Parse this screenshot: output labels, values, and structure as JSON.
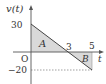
{
  "diagram": {
    "type": "velocity-time graph",
    "y_axis_label": "v(t)",
    "x_axis_label": "t",
    "origin_label": "O",
    "y_ticks": [
      {
        "value": 30,
        "label": "30"
      },
      {
        "value": -20,
        "label": "−20"
      }
    ],
    "x_ticks": [
      {
        "value": 3,
        "label": "3"
      },
      {
        "value": 5,
        "label": "5"
      }
    ],
    "regions": [
      {
        "label": "A",
        "description": "shaded triangle between the line and the t-axis from t=0 to t=3, above the axis"
      },
      {
        "label": "B",
        "description": "shaded triangle between the line and the t-axis from t=3 to t=5, below the axis"
      }
    ],
    "line_points": [
      {
        "t": 0,
        "v": 30
      },
      {
        "t": 3,
        "v": 0
      },
      {
        "t": 5,
        "v": -20
      }
    ],
    "colors": {
      "axis": "#555555",
      "line": "#444444",
      "shade": "#d9d9d9",
      "text": "#333333"
    }
  }
}
